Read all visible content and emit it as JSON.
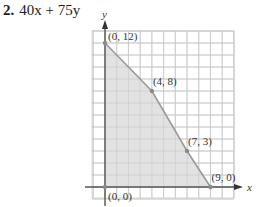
{
  "problem": {
    "number": "2.",
    "expression": "40x + 75y"
  },
  "chart_data": {
    "type": "area",
    "title": "40x + 75y",
    "xlabel": "x",
    "ylabel": "y",
    "xlim": [
      -1,
      11
    ],
    "ylim": [
      -1,
      13
    ],
    "grid": true,
    "grid_step": 1,
    "region_vertices": [
      {
        "x": 0,
        "y": 0
      },
      {
        "x": 0,
        "y": 12
      },
      {
        "x": 4,
        "y": 8
      },
      {
        "x": 7,
        "y": 3
      },
      {
        "x": 9,
        "y": 0
      }
    ],
    "points": [
      {
        "x": 0,
        "y": 12,
        "label": "(0, 12)",
        "label_pos": "right"
      },
      {
        "x": 4,
        "y": 8,
        "label": "(4, 8)",
        "label_pos": "above-right"
      },
      {
        "x": 7,
        "y": 3,
        "label": "(7, 3)",
        "label_pos": "above-right"
      },
      {
        "x": 9,
        "y": 0,
        "label": "(9, 0)",
        "label_pos": "above-right"
      },
      {
        "x": 0,
        "y": 0,
        "label": "(0, 0)",
        "label_pos": "below-right"
      }
    ],
    "colors": {
      "fill": "#e2e2e2",
      "grid": "#c8c8c8",
      "axis": "#555555",
      "boundary": "#9a9a9a",
      "point": "#8a8a8a"
    }
  }
}
